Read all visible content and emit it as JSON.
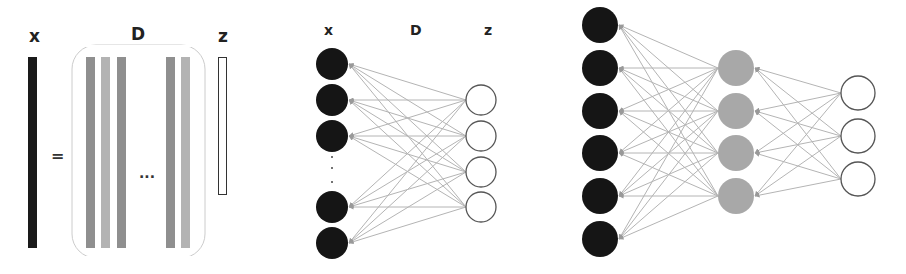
{
  "colors": {
    "background": "#ffffff",
    "input_node": "#151515",
    "hidden_node": "#a8a8a8",
    "output_node_fill": "#ffffff",
    "output_node_stroke": "#555555",
    "edge": "#b4b4b4",
    "arrow": "#999999",
    "bar_x": "#1a1a1a",
    "bar_dark": "#8f8f8f",
    "bar_light": "#b3b3b3",
    "bracket": "#cccccc",
    "label": "#222222"
  },
  "panel_matrix": {
    "labels": {
      "x": "x",
      "D": "D",
      "z": "z"
    },
    "equals": "=",
    "ellipsis": "...",
    "x_bar": {
      "x": 28,
      "y": 57,
      "w": 9,
      "h": 191
    },
    "d_bars": [
      {
        "x": 86,
        "shade": "dark"
      },
      {
        "x": 101,
        "shade": "light"
      },
      {
        "x": 117,
        "shade": "dark"
      },
      {
        "x": 166,
        "shade": "dark"
      },
      {
        "x": 181,
        "shade": "light"
      }
    ],
    "d_bar_y": 57,
    "d_bar_w": 9,
    "d_bar_h": 191,
    "bracket": {
      "x": 72,
      "y": 45,
      "w": 133,
      "h": 213,
      "r": 24
    },
    "z_bar": {
      "x": 218,
      "y": 57,
      "w": 8,
      "h": 137
    }
  },
  "panel_network_single": {
    "labels": {
      "x": "x",
      "D": "D",
      "z": "z"
    },
    "label_positions": {
      "x": 330,
      "D": 416,
      "z": 489,
      "y": 35
    },
    "input_nodes": {
      "cx": 332,
      "r": 16,
      "ys": [
        64,
        100,
        136,
        207,
        243
      ]
    },
    "vertical_ellipsis_dots": [
      157,
      168,
      182
    ],
    "output_nodes": {
      "cx": 481,
      "r": 15,
      "ys": [
        100,
        136,
        172,
        207
      ]
    }
  },
  "panel_network_deep": {
    "input_nodes": {
      "cx": 600,
      "r": 18,
      "ys": [
        25,
        68,
        111,
        153,
        196,
        239
      ]
    },
    "hidden_nodes": {
      "cx": 736,
      "r": 18,
      "ys": [
        68,
        111,
        153,
        196
      ]
    },
    "output_nodes": {
      "cx": 858,
      "r": 17,
      "ys": [
        93,
        136,
        179
      ]
    }
  }
}
